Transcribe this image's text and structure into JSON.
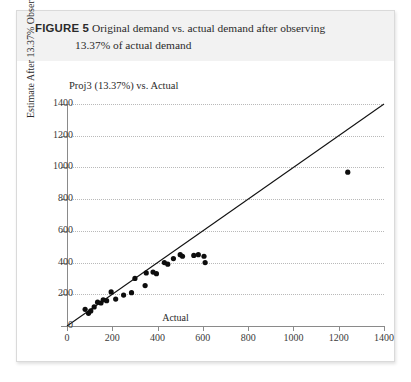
{
  "figure": {
    "label": "FIGURE 5",
    "caption_line1": "Original demand vs. actual demand after observing",
    "caption_line2": "13.37% of actual demand"
  },
  "chart_data": {
    "type": "scatter",
    "title": "Proj3 (13.37%) vs. Actual",
    "xlabel": "Actual",
    "ylabel": "Estimate After 13.37% Observed (3 weeks)",
    "xlim": [
      0,
      1400
    ],
    "ylim": [
      0,
      1400
    ],
    "xticks": [
      0,
      200,
      400,
      600,
      800,
      1000,
      1200,
      1400
    ],
    "yticks": [
      0,
      200,
      400,
      600,
      800,
      1000,
      1200,
      1400
    ],
    "grid": "horizontal-dotted",
    "legend": "none",
    "series": [
      {
        "name": "Proj3 (13.37%) vs. Actual",
        "marker": "filled-circle",
        "points": [
          [
            80,
            105
          ],
          [
            95,
            80
          ],
          [
            105,
            95
          ],
          [
            120,
            120
          ],
          [
            135,
            150
          ],
          [
            150,
            145
          ],
          [
            160,
            165
          ],
          [
            175,
            160
          ],
          [
            195,
            215
          ],
          [
            215,
            170
          ],
          [
            250,
            195
          ],
          [
            285,
            210
          ],
          [
            300,
            300
          ],
          [
            345,
            255
          ],
          [
            350,
            335
          ],
          [
            380,
            340
          ],
          [
            395,
            330
          ],
          [
            430,
            400
          ],
          [
            445,
            390
          ],
          [
            470,
            425
          ],
          [
            500,
            450
          ],
          [
            510,
            440
          ],
          [
            560,
            445
          ],
          [
            580,
            450
          ],
          [
            605,
            440
          ],
          [
            610,
            400
          ],
          [
            1240,
            970
          ]
        ]
      }
    ],
    "reference_line": {
      "name": "45-degree reference line",
      "from": [
        0,
        0
      ],
      "to": [
        1400,
        1400
      ]
    }
  }
}
